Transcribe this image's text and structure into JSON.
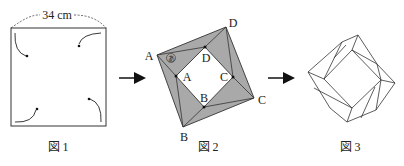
{
  "figure1": {
    "caption": "図 1",
    "dimension_label": "34 cm",
    "description": "square sheet with four corners folded toward center"
  },
  "figure2": {
    "caption": "図 2",
    "outer_labels": {
      "A": "A",
      "B": "B",
      "C": "C",
      "D": "D"
    },
    "inner_labels": {
      "A": "A",
      "B": "B",
      "C": "C",
      "D": "D"
    },
    "angle_mark": "あ",
    "fill_color": "#a9a9a9"
  },
  "figure3": {
    "caption": "図 3"
  },
  "arrows": [
    "right-arrow",
    "right-arrow"
  ]
}
